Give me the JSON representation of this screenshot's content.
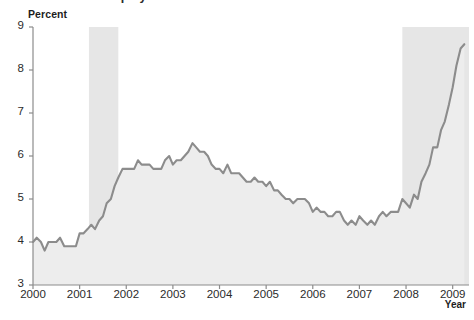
{
  "chart_data": {
    "type": "area",
    "title": "Unemployment rate",
    "ylabel": "Percent",
    "xlabel": "Year",
    "xlim": [
      2000.0,
      2009.35
    ],
    "ylim": [
      3,
      9
    ],
    "grid": false,
    "legend": "none",
    "yticks": [
      3,
      4,
      5,
      6,
      7,
      8,
      9
    ],
    "ytick_labels": [
      "3",
      "4",
      "5",
      "6",
      "7",
      "8",
      "9"
    ],
    "xticks": [
      2000,
      2001,
      2002,
      2003,
      2004,
      2005,
      2006,
      2007,
      2008,
      2009
    ],
    "xtick_labels": [
      "2000",
      "2001",
      "2002",
      "2003",
      "2004",
      "2005",
      "2006",
      "2007",
      "2008",
      "2009"
    ],
    "line_color": "#8c8c8c",
    "fill_color": "#ededed",
    "recession_band_color": "#e6e6e6",
    "shaded_regions": [
      {
        "name": "recession-2001",
        "start": 2001.2,
        "end": 2001.83
      },
      {
        "name": "recession-2008",
        "start": 2007.92,
        "end": 2009.35
      }
    ],
    "x": [
      2000.0,
      2000.08,
      2000.17,
      2000.25,
      2000.33,
      2000.42,
      2000.5,
      2000.58,
      2000.67,
      2000.75,
      2000.83,
      2000.92,
      2001.0,
      2001.08,
      2001.17,
      2001.25,
      2001.33,
      2001.42,
      2001.5,
      2001.58,
      2001.67,
      2001.75,
      2001.83,
      2001.92,
      2002.0,
      2002.08,
      2002.17,
      2002.25,
      2002.33,
      2002.42,
      2002.5,
      2002.58,
      2002.67,
      2002.75,
      2002.83,
      2002.92,
      2003.0,
      2003.08,
      2003.17,
      2003.25,
      2003.33,
      2003.42,
      2003.5,
      2003.58,
      2003.67,
      2003.75,
      2003.83,
      2003.92,
      2004.0,
      2004.08,
      2004.17,
      2004.25,
      2004.33,
      2004.42,
      2004.5,
      2004.58,
      2004.67,
      2004.75,
      2004.83,
      2004.92,
      2005.0,
      2005.08,
      2005.17,
      2005.25,
      2005.33,
      2005.42,
      2005.5,
      2005.58,
      2005.67,
      2005.75,
      2005.83,
      2005.92,
      2006.0,
      2006.08,
      2006.17,
      2006.25,
      2006.33,
      2006.42,
      2006.5,
      2006.58,
      2006.67,
      2006.75,
      2006.83,
      2006.92,
      2007.0,
      2007.08,
      2007.17,
      2007.25,
      2007.33,
      2007.42,
      2007.5,
      2007.58,
      2007.67,
      2007.75,
      2007.83,
      2007.92,
      2008.0,
      2008.08,
      2008.17,
      2008.25,
      2008.33,
      2008.42,
      2008.5,
      2008.58,
      2008.67,
      2008.75,
      2008.83,
      2008.92,
      2009.0,
      2009.08,
      2009.17,
      2009.25
    ],
    "values": [
      4.0,
      4.1,
      4.0,
      3.8,
      4.0,
      4.0,
      4.0,
      4.1,
      3.9,
      3.9,
      3.9,
      3.9,
      4.2,
      4.2,
      4.3,
      4.4,
      4.3,
      4.5,
      4.6,
      4.9,
      5.0,
      5.3,
      5.5,
      5.7,
      5.7,
      5.7,
      5.7,
      5.9,
      5.8,
      5.8,
      5.8,
      5.7,
      5.7,
      5.7,
      5.9,
      6.0,
      5.8,
      5.9,
      5.9,
      6.0,
      6.1,
      6.3,
      6.2,
      6.1,
      6.1,
      6.0,
      5.8,
      5.7,
      5.7,
      5.6,
      5.8,
      5.6,
      5.6,
      5.6,
      5.5,
      5.4,
      5.4,
      5.5,
      5.4,
      5.4,
      5.3,
      5.4,
      5.2,
      5.2,
      5.1,
      5.0,
      5.0,
      4.9,
      5.0,
      5.0,
      5.0,
      4.9,
      4.7,
      4.8,
      4.7,
      4.7,
      4.6,
      4.6,
      4.7,
      4.7,
      4.5,
      4.4,
      4.5,
      4.4,
      4.6,
      4.5,
      4.4,
      4.5,
      4.4,
      4.6,
      4.7,
      4.6,
      4.7,
      4.7,
      4.7,
      5.0,
      4.9,
      4.8,
      5.1,
      5.0,
      5.4,
      5.6,
      5.8,
      6.2,
      6.2,
      6.6,
      6.8,
      7.2,
      7.6,
      8.1,
      8.5,
      8.6
    ]
  }
}
